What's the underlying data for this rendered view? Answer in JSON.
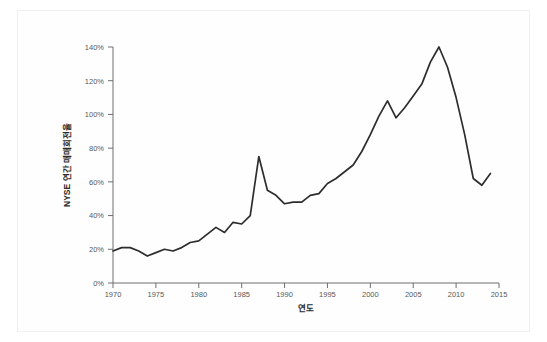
{
  "chart_data": {
    "type": "line",
    "title": "",
    "xlabel": "연도",
    "ylabel": "NYSE 연간 매매회전율",
    "xlim": [
      1970,
      2015
    ],
    "ylim": [
      0,
      140
    ],
    "grid": false,
    "legend": null,
    "y_tick_labels": [
      "0%",
      "20%",
      "40%",
      "60%",
      "80%",
      "100%",
      "120%",
      "140%"
    ],
    "y_tick_values": [
      0,
      20,
      40,
      60,
      80,
      100,
      120,
      140
    ],
    "x_tick_labels": [
      "1970",
      "1975",
      "1980",
      "1985",
      "1990",
      "1995",
      "2000",
      "2005",
      "2010",
      "2015"
    ],
    "x_tick_values": [
      1970,
      1975,
      1980,
      1985,
      1990,
      1995,
      2000,
      2005,
      2010,
      2015
    ],
    "series": [
      {
        "name": "NYSE 연간 매매회전율",
        "color": "#2d2d2f",
        "x": [
          1970,
          1971,
          1972,
          1973,
          1974,
          1975,
          1976,
          1977,
          1978,
          1979,
          1980,
          1981,
          1982,
          1983,
          1984,
          1985,
          1986,
          1987,
          1988,
          1989,
          1990,
          1991,
          1992,
          1993,
          1994,
          1995,
          1996,
          1997,
          1998,
          1999,
          2000,
          2001,
          2002,
          2003,
          2004,
          2005,
          2006,
          2007,
          2008,
          2009,
          2010,
          2011,
          2012,
          2013,
          2014
        ],
        "values": [
          19,
          21,
          21,
          19,
          16,
          18,
          20,
          19,
          21,
          24,
          25,
          29,
          33,
          30,
          36,
          35,
          40,
          75,
          55,
          52,
          47,
          48,
          48,
          52,
          53,
          59,
          62,
          66,
          70,
          78,
          88,
          99,
          108,
          98,
          104,
          111,
          118,
          131,
          140,
          128,
          110,
          88,
          62,
          58,
          65
        ]
      }
    ]
  }
}
